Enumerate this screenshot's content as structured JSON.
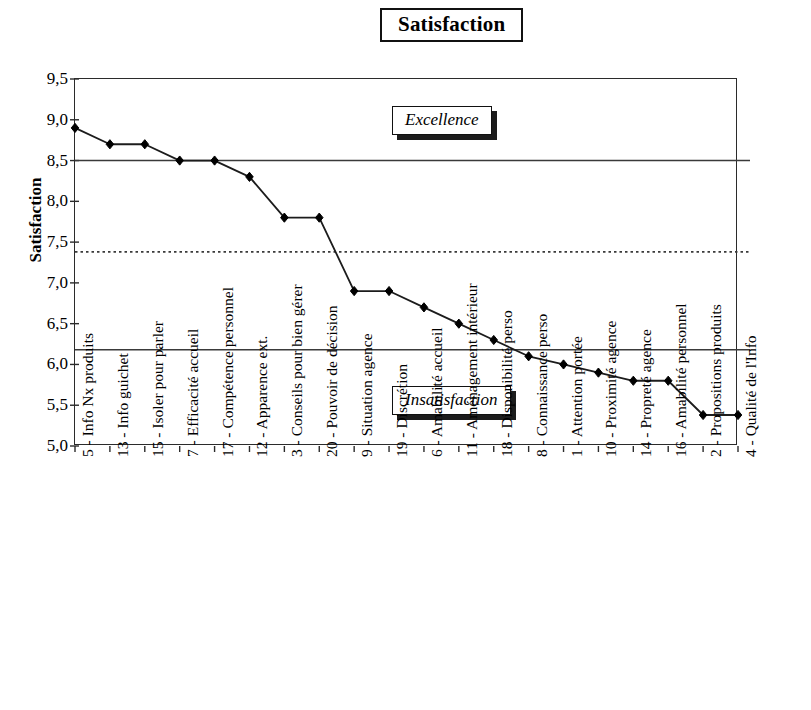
{
  "chart_data": {
    "type": "line",
    "title": "Satisfaction",
    "xlabel": "",
    "ylabel": "Satisfaction",
    "ylim": [
      5.0,
      9.5
    ],
    "ytick_labels": [
      "9,5",
      "9,0",
      "8,5",
      "8,0",
      "7,5",
      "7,0",
      "6,5",
      "6,0",
      "5,5",
      "5,0"
    ],
    "ytick_values": [
      9.5,
      9.0,
      8.5,
      8.0,
      7.5,
      7.0,
      6.5,
      6.0,
      5.5,
      5.0
    ],
    "grid": false,
    "legend": "none",
    "marker": "diamond",
    "line_color": "#1c1c1c",
    "marker_color": "#000000",
    "categories": [
      "5 - Info Nx produits",
      "13 - Info guichet",
      "15 - Isoler pour parler",
      "7 - Efficacité accueil",
      "17 - Compétence personnel",
      "12 - Apparence ext.",
      "3 - Conseils pour bien gérer",
      "20 - Pouvoir de décision",
      "9 - Situation agence",
      "19 - Discrétion",
      "6 - Amabilité accueil",
      "11 - Aménagement intérieur",
      "18 - Disponibilité perso",
      "8 - Connaissance perso",
      "1 - Attention portée",
      "10 - Proximité agence",
      "14 - Propreté agence",
      "16 - Amabilité personnel",
      "2 - Propositions produits",
      "4 - Qualité de l'Info"
    ],
    "values": [
      8.9,
      8.7,
      8.7,
      8.5,
      8.5,
      8.3,
      7.8,
      7.8,
      6.9,
      6.9,
      6.7,
      6.5,
      6.3,
      6.1,
      6.0,
      5.9,
      5.8,
      5.8,
      5.38,
      5.38
    ],
    "reference_lines": [
      {
        "name": "excellence-threshold",
        "value": 8.5,
        "style": "solid"
      },
      {
        "name": "mean-line",
        "value": 7.38,
        "style": "dotted"
      },
      {
        "name": "insatisfaction-threshold",
        "value": 6.18,
        "style": "solid"
      }
    ],
    "annotations": [
      {
        "name": "excellence",
        "text": "Excellence"
      },
      {
        "name": "insatisfaction",
        "text": "Insatisfaction"
      }
    ]
  }
}
